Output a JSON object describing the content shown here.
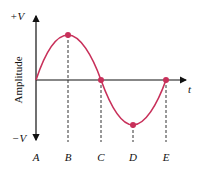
{
  "diagram": {
    "y_axis_label": "Amplitude",
    "y_top_label": "+V",
    "y_bottom_label": "−V",
    "x_axis_label": "t",
    "points": [
      "A",
      "B",
      "C",
      "D",
      "E"
    ],
    "curve_color": "#c8305a",
    "axis_color": "#111111"
  }
}
